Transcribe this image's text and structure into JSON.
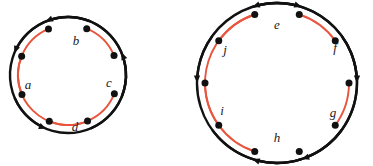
{
  "figure": {
    "width": 373,
    "height": 166,
    "background": "#ffffff",
    "colors": {
      "red_arc": "#e8543c",
      "black_arc": "#111111",
      "dot": "#111111",
      "label": "#1a1a1a"
    }
  },
  "chart_data": {
    "type": "diagram",
    "xlabel": "",
    "ylabel": "",
    "grid": false,
    "legend": "none",
    "circles": [
      {
        "name": "left-circle",
        "center": [
          68,
          75
        ],
        "radius": 50,
        "node_count": 8,
        "node_angles_deg": [
          248,
          203,
          158,
          113,
          68,
          23,
          338,
          293
        ],
        "arcs": [
          {
            "label": "a",
            "color": "#111111",
            "direction": "counterclockwise",
            "start_deg": 203,
            "end_deg": 158,
            "label_pos": [
              28,
              86
            ],
            "arrowhead": "end"
          },
          {
            "label": "b",
            "color": "#111111",
            "direction": "counterclockwise",
            "start_deg": 68,
            "end_deg": 113,
            "label_pos": [
              76,
              42
            ],
            "arrowhead": "end"
          },
          {
            "label": "c",
            "color": "#111111",
            "direction": "counterclockwise",
            "start_deg": 338,
            "end_deg": 23,
            "label_pos": [
              109,
              84
            ],
            "arrowhead": "end"
          },
          {
            "label": "d",
            "color": "#111111",
            "direction": "counterclockwise",
            "start_deg": 293,
            "end_deg": 248,
            "label_pos": [
              75,
              128
            ],
            "arrowhead": "end"
          }
        ],
        "red_arc_count": 4
      },
      {
        "name": "right-circle",
        "center": [
          277,
          83
        ],
        "radius": 72,
        "node_count": 10,
        "node_angles_deg": [
          252,
          216,
          180,
          144,
          108,
          72,
          36,
          0,
          324,
          288
        ],
        "arcs": [
          {
            "label": "e",
            "color": "#111111",
            "direction": "clockwise",
            "start_deg": 108,
            "end_deg": 72,
            "label_pos": [
              277,
              26
            ],
            "arrowhead": "end"
          },
          {
            "label": "f",
            "color": "#111111",
            "direction": "clockwise",
            "start_deg": 36,
            "end_deg": 0,
            "label_pos": [
              335,
              49
            ],
            "arrowhead": "end"
          },
          {
            "label": "g",
            "color": "#111111",
            "direction": "clockwise",
            "start_deg": 324,
            "end_deg": 288,
            "label_pos": [
              333,
              114
            ],
            "arrowhead": "end"
          },
          {
            "label": "h",
            "color": "#111111",
            "direction": "clockwise",
            "start_deg": 288,
            "end_deg": 252,
            "label_pos": [
              277,
              139
            ],
            "arrowhead": "end"
          },
          {
            "label": "i",
            "color": "#111111",
            "direction": "counterclockwise",
            "start_deg": 216,
            "end_deg": 180,
            "label_pos": [
              222,
              112
            ],
            "arrowhead": "end"
          },
          {
            "label": "j",
            "color": "#111111",
            "direction": "counterclockwise",
            "start_deg": 144,
            "end_deg": 108,
            "label_pos": [
              225,
              51
            ],
            "arrowhead": "end"
          }
        ],
        "red_arc_count": 4
      }
    ],
    "labels": [
      "a",
      "b",
      "c",
      "d",
      "e",
      "f",
      "g",
      "h",
      "i",
      "j"
    ]
  }
}
